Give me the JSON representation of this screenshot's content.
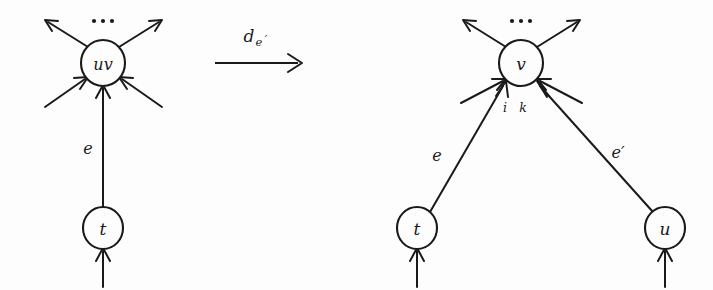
{
  "figure": {
    "type": "graph-rewriting-diagram",
    "background_color": "#fdfdfd",
    "ink_color": "#1a1a1a"
  },
  "left_graph": {
    "name": "left-graph",
    "nodes": [
      {
        "id": "uv",
        "label": "uv",
        "cx": 103,
        "cy": 63,
        "r": 22
      },
      {
        "id": "t",
        "label": "t",
        "cx": 103,
        "cy": 228,
        "r": 20
      }
    ],
    "ellipsis": {
      "label": "...",
      "dots": 3,
      "cx": 103,
      "cy": 21
    },
    "edges": [
      {
        "id": "e",
        "label": "e",
        "from": "t",
        "to": "uv",
        "label_x": 88,
        "label_y": 148
      }
    ],
    "open_edges": [
      {
        "id": "out-upper-left",
        "direction": "outgoing",
        "side": "upper-left"
      },
      {
        "id": "out-upper-right",
        "direction": "outgoing",
        "side": "upper-right"
      },
      {
        "id": "in-lower-left",
        "direction": "incoming",
        "side": "lower-left"
      },
      {
        "id": "in-lower-right",
        "direction": "incoming",
        "side": "lower-right"
      },
      {
        "id": "in-below-t",
        "direction": "incoming",
        "side": "below",
        "target": "t"
      }
    ]
  },
  "transformation": {
    "name": "transformation-arrow",
    "label_base": "d",
    "label_subscript": "e",
    "label_subscript_prime": "′",
    "label_plain": "d_e'",
    "arrow_from_x": 215,
    "arrow_to_x": 302,
    "arrow_y": 63,
    "label_x": 258,
    "label_y": 37
  },
  "right_graph": {
    "name": "right-graph",
    "nodes": [
      {
        "id": "v",
        "label": "v",
        "cx": 521,
        "cy": 63,
        "r": 22
      },
      {
        "id": "t",
        "label": "t",
        "cx": 417,
        "cy": 228,
        "r": 20
      },
      {
        "id": "u",
        "label": "u",
        "cx": 665,
        "cy": 228,
        "r": 20
      }
    ],
    "ellipsis": {
      "label": "...",
      "dots": 3,
      "cx": 521,
      "cy": 21
    },
    "edges": [
      {
        "id": "e",
        "label": "e",
        "from": "t",
        "to": "v",
        "port": "i",
        "label_x": 437,
        "label_y": 155
      },
      {
        "id": "e-prime",
        "label": "e′",
        "from": "u",
        "to": "v",
        "port": "k",
        "label_x": 618,
        "label_y": 152
      }
    ],
    "port_labels": [
      {
        "id": "port-i",
        "label": "i",
        "x": 505,
        "y": 107
      },
      {
        "id": "port-k",
        "label": "k",
        "x": 523,
        "y": 107
      }
    ],
    "open_edges": [
      {
        "id": "out-upper-left",
        "direction": "outgoing",
        "side": "upper-left"
      },
      {
        "id": "out-upper-right",
        "direction": "outgoing",
        "side": "upper-right"
      },
      {
        "id": "in-lower-left",
        "direction": "incoming",
        "side": "lower-left"
      },
      {
        "id": "in-lower-right",
        "direction": "incoming",
        "side": "lower-right"
      },
      {
        "id": "in-below-t",
        "direction": "incoming",
        "side": "below",
        "target": "t"
      },
      {
        "id": "in-below-u",
        "direction": "incoming",
        "side": "below",
        "target": "u"
      }
    ]
  }
}
